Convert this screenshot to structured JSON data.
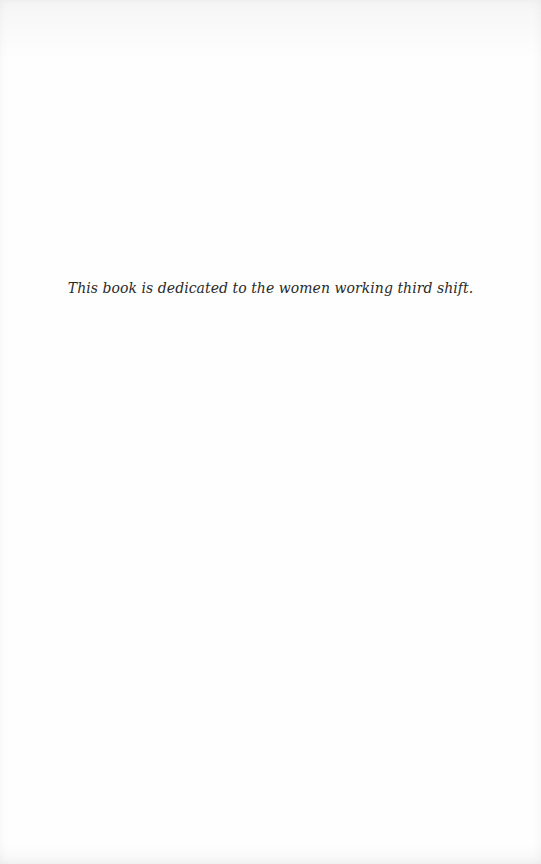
{
  "page": {
    "type": "dedication",
    "dedication_text": "This book is dedicated to the women working third shift."
  },
  "colors": {
    "background": "#fefefe",
    "text": "#2a2a2a"
  }
}
